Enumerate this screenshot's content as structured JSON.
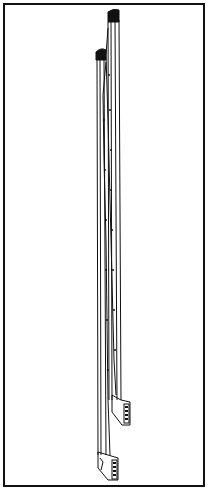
{
  "figure": {
    "colors": {
      "ink": "#111111",
      "paper": "#ffffff"
    },
    "parts": [
      {
        "name": "rear-post",
        "cap_top_y": 10,
        "foot_bottom_y": 425
      },
      {
        "name": "front-post",
        "cap_top_y": 48,
        "foot_bottom_y": 480
      }
    ]
  }
}
